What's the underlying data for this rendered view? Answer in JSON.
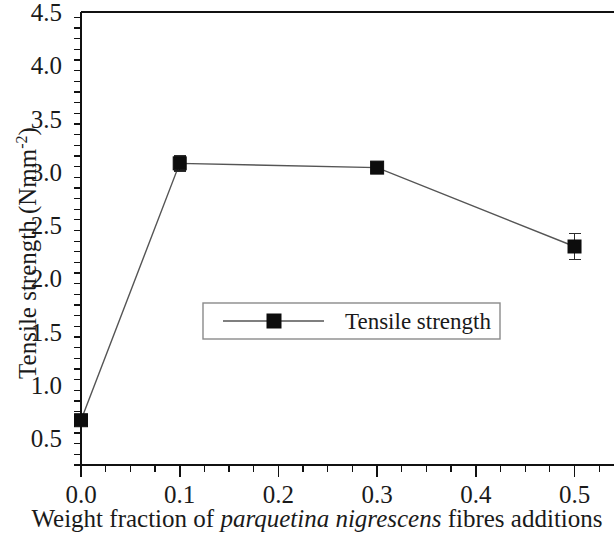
{
  "chart_data": {
    "type": "line",
    "title": "",
    "xlabel_parts": {
      "pre": "Weight fraction of ",
      "italic": "parquetina nigrescens",
      "post": " fibres additions"
    },
    "xlabel": "Weight fraction of parquetina nigrescens fibres additions",
    "ylabel_parts": {
      "base": "Tensile strength (Nmm",
      "superscript": "-2",
      "tail": ")"
    },
    "ylabel": "Tensile strength (Nmm-2)",
    "x": [
      0.0,
      0.1,
      0.3,
      0.5
    ],
    "values": [
      0.67,
      3.08,
      3.04,
      2.3
    ],
    "errors": [
      0.02,
      0.07,
      0.03,
      0.12
    ],
    "series": [
      {
        "name": "Tensile strength",
        "x": [
          0.0,
          0.1,
          0.3,
          0.5
        ],
        "values": [
          0.67,
          3.08,
          3.04,
          2.3
        ],
        "errors": [
          0.02,
          0.07,
          0.03,
          0.12
        ],
        "marker": "filled-square",
        "color": "#0d0d0d"
      }
    ],
    "xlim": [
      0.0,
      0.54
    ],
    "ylim": [
      0.25,
      4.5
    ],
    "xticks": [
      0.0,
      0.1,
      0.2,
      0.3,
      0.4,
      0.5
    ],
    "xtick_labels": [
      "0.0",
      "0.1",
      "0.2",
      "0.3",
      "0.4",
      "0.5"
    ],
    "yticks": [
      0.5,
      1.0,
      1.5,
      2.0,
      2.5,
      3.0,
      3.5,
      4.0,
      4.5
    ],
    "ytick_labels": [
      "0.5",
      "1.0",
      "1.5",
      "2.0",
      "2.5",
      "3.0",
      "3.5",
      "4.0",
      "4.5"
    ],
    "y_minor_step": 0.1,
    "x_minor_step": 0.025,
    "grid": false,
    "legend": {
      "entries": [
        "Tensile strength"
      ],
      "position": "center",
      "border": true
    },
    "spines": {
      "left": true,
      "bottom": true,
      "top": true,
      "right": false
    },
    "tick_direction": "out",
    "line_color": "#555555",
    "marker_color": "#0d0d0d",
    "background": "#ffffff"
  }
}
